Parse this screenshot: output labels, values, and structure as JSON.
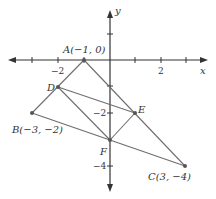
{
  "figure": {
    "axes": {
      "x_label": "x",
      "y_label": "y",
      "x_ticks": [
        -3,
        -2,
        -1,
        1,
        2,
        3
      ],
      "y_ticks": [
        1,
        -1,
        -2,
        -3,
        -4
      ],
      "x_tick_labels": [
        {
          "value": -2,
          "text": "−2"
        },
        {
          "value": 2,
          "text": "2"
        }
      ],
      "y_tick_labels": [
        {
          "value": -2,
          "text": "−2"
        },
        {
          "value": -4,
          "text": "−4"
        }
      ]
    },
    "points": [
      {
        "name": "A",
        "x": -1,
        "y": 0,
        "label": "A(−1, 0)"
      },
      {
        "name": "B",
        "x": -3,
        "y": -2,
        "label": "B(−3, −2)"
      },
      {
        "name": "C",
        "x": 3,
        "y": -4,
        "label": "C(3, −4)"
      },
      {
        "name": "D",
        "x": -2,
        "y": -1,
        "label": "D"
      },
      {
        "name": "E",
        "x": 1,
        "y": -2,
        "label": "E"
      },
      {
        "name": "F",
        "x": 0,
        "y": -3,
        "label": "F"
      }
    ],
    "segments": [
      [
        "A",
        "B"
      ],
      [
        "A",
        "C"
      ],
      [
        "B",
        "C"
      ],
      [
        "D",
        "E"
      ],
      [
        "D",
        "F"
      ],
      [
        "E",
        "F"
      ]
    ],
    "colors": {
      "line": "#6e6e6e",
      "axis": "#333333",
      "point": "#555555"
    }
  }
}
